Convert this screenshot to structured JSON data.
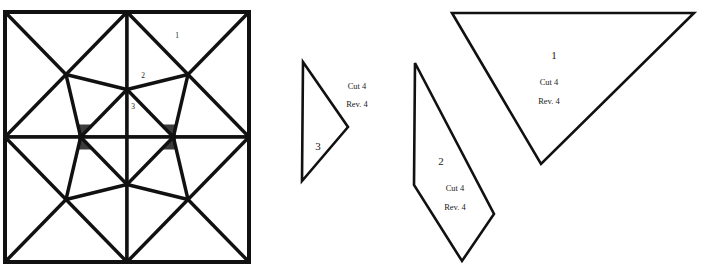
{
  "figure": {
    "type": "quilt-pattern-sheet",
    "background_color": "#ffffff",
    "ink_color": "#111111"
  },
  "quilt_block": {
    "name": "eight-pointed-star-block",
    "x": 5,
    "y": 12,
    "width": 246,
    "height": 250,
    "center_x": 127,
    "center_y": 137,
    "fabrics": [
      {
        "id": "stipple",
        "name": "speckled-gray-fabric",
        "base": "#ffffff",
        "dot_color": "#3a3a3a"
      },
      {
        "id": "sprig",
        "name": "leaf-sprig-print-fabric",
        "base": "#ffffff",
        "motif_color": "#141414"
      }
    ],
    "labels": [
      {
        "text": "1",
        "x": 177,
        "y": 38
      },
      {
        "text": "2",
        "x": 143,
        "y": 78
      },
      {
        "text": "3",
        "x": 133,
        "y": 109
      }
    ]
  },
  "pattern_pieces": [
    {
      "id": "piece-3",
      "number": "3",
      "number_x": 318,
      "number_y": 150,
      "cut_label": "Cut 4",
      "cut_x": 357,
      "cut_y": 89,
      "rev_label": "Rev. 4",
      "rev_x": 357,
      "rev_y": 107,
      "points": "303,62 348,127 302,181"
    },
    {
      "id": "piece-2",
      "number": "2",
      "number_x": 441,
      "number_y": 165,
      "cut_label": "Cut 4",
      "cut_x": 455,
      "cut_y": 191,
      "rev_label": "Rev. 4",
      "rev_x": 455,
      "rev_y": 210,
      "points": "415,63 494,214 462,261 414,185"
    },
    {
      "id": "piece-1",
      "number": "1",
      "number_x": 554,
      "number_y": 59,
      "cut_label": "Cut 4",
      "cut_x": 549,
      "cut_y": 85,
      "rev_label": "Rev. 4",
      "rev_x": 549,
      "rev_y": 104,
      "points": "452,13 694,13 541,164"
    }
  ]
}
